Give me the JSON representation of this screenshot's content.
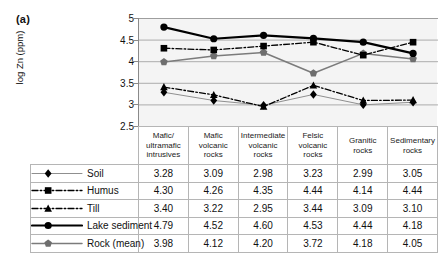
{
  "panel": {
    "label": "(a)"
  },
  "chart_data": {
    "type": "line",
    "title": "",
    "xlabel": "",
    "ylabel": "log Zn (ppm)",
    "ylim": [
      2.5,
      5
    ],
    "ytick_step": 0.5,
    "yticks": [
      "5",
      "4.5",
      "4",
      "3.5",
      "3",
      "2.5"
    ],
    "grid": true,
    "legend_position": "table-left-column",
    "categories": [
      "Mafic/ ultramafic intrusives",
      "Mafic volcanic rocks",
      "Intermediate volcanic rocks",
      "Felsic volcanic rocks",
      "Granitic rocks",
      "Sedimentary rocks"
    ],
    "category_lines": [
      [
        "Mafic/",
        "ultramafic",
        "intrusives"
      ],
      [
        "Mafic",
        "volcanic",
        "rocks"
      ],
      [
        "Intermediate",
        "volcanic",
        "rocks"
      ],
      [
        "Felsic",
        "volcanic",
        "rocks"
      ],
      [
        "Granitic",
        "rocks"
      ],
      [
        "Sedimentary",
        "rocks"
      ]
    ],
    "series": [
      {
        "name": "Soil",
        "marker": "diamond",
        "line_style": "solid-thin",
        "color": "#8f8f8f",
        "marker_color": "#000000",
        "values": [
          3.28,
          3.09,
          2.98,
          3.23,
          2.99,
          3.05
        ],
        "values_text": [
          "3.28",
          "3.09",
          "2.98",
          "3.23",
          "2.99",
          "3.05"
        ]
      },
      {
        "name": "Humus",
        "marker": "square",
        "line_style": "dash-dot",
        "color": "#000000",
        "marker_color": "#000000",
        "values": [
          4.3,
          4.26,
          4.35,
          4.44,
          4.14,
          4.44
        ],
        "values_text": [
          "4.30",
          "4.26",
          "4.35",
          "4.44",
          "4.14",
          "4.44"
        ]
      },
      {
        "name": "Till",
        "marker": "triangle",
        "line_style": "dash-dot",
        "color": "#000000",
        "marker_color": "#000000",
        "values": [
          3.4,
          3.22,
          2.95,
          3.44,
          3.09,
          3.1
        ],
        "values_text": [
          "3.40",
          "3.22",
          "2.95",
          "3.44",
          "3.09",
          "3.10"
        ]
      },
      {
        "name": "Lake sediment",
        "marker": "circle",
        "line_style": "solid-thick",
        "color": "#000000",
        "marker_color": "#000000",
        "values": [
          4.79,
          4.52,
          4.6,
          4.53,
          4.44,
          4.18
        ],
        "values_text": [
          "4.79",
          "4.52",
          "4.60",
          "4.53",
          "4.44",
          "4.18"
        ]
      },
      {
        "name": "Rock (mean)",
        "marker": "pentagon",
        "line_style": "solid-medium",
        "color": "#7b7b7b",
        "marker_color": "#6e6e6e",
        "values": [
          3.98,
          4.12,
          4.2,
          3.72,
          4.18,
          4.05
        ],
        "values_text": [
          "3.98",
          "4.12",
          "4.20",
          "3.72",
          "4.18",
          "4.05"
        ]
      }
    ]
  },
  "colors": {
    "plot_background": "#f4f4f4",
    "gridline": "#9a9a9a",
    "axis": "#8a8a8a",
    "table_border": "#b5b5b5",
    "text": "#111111"
  }
}
